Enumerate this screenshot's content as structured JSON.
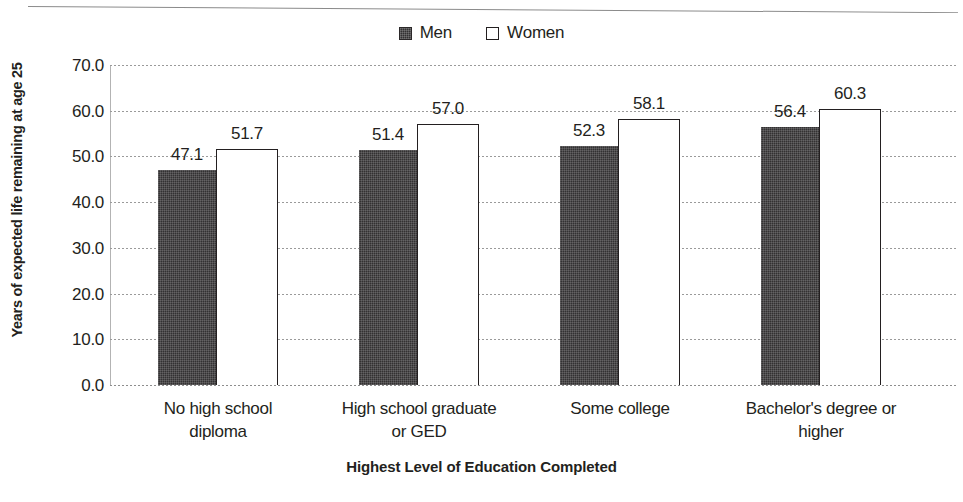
{
  "chart_data": {
    "type": "bar",
    "title": "",
    "subtitle": "",
    "xlabel": "Highest Level of Education Completed",
    "ylabel": "Years of expected life remaining at age 25",
    "categories": [
      "No high school diploma",
      "High school graduate or GED",
      "Some college",
      "Bachelor's degree or higher"
    ],
    "category_lines": [
      [
        "No high school",
        "diploma"
      ],
      [
        "High school graduate",
        "or GED"
      ],
      [
        "Some college",
        ""
      ],
      [
        "Bachelor's degree or",
        "higher"
      ]
    ],
    "series": [
      {
        "name": "Men",
        "color": "#333132",
        "style": "solid-dark-hatched",
        "values": [
          47.1,
          51.4,
          52.3,
          56.4
        ],
        "labels": [
          "47.1",
          "51.4",
          "52.3",
          "56.4"
        ]
      },
      {
        "name": "Women",
        "color": "#ffffff",
        "style": "white-outlined",
        "values": [
          51.7,
          57.0,
          58.1,
          60.3
        ],
        "labels": [
          "51.7",
          "57.0",
          "58.1",
          "60.3"
        ]
      }
    ],
    "ylim": [
      0.0,
      70.0
    ],
    "ytick_step": 10.0,
    "ytick_labels": [
      "70.0",
      "60.0",
      "50.0",
      "40.0",
      "30.0",
      "20.0",
      "10.0",
      "0.0"
    ],
    "ytick_values": [
      70.0,
      60.0,
      50.0,
      40.0,
      30.0,
      20.0,
      10.0,
      0.0
    ],
    "grid": true,
    "grid_style": "dotted",
    "legend_position": "top-center",
    "legend": [
      "Men",
      "Women"
    ],
    "bar_mode": "grouped-adjacent"
  },
  "legend": {
    "men": "Men",
    "women": "Women"
  },
  "axes": {
    "y_title": "Years of expected life remaining at age 25",
    "x_title": "Highest Level of Education Completed"
  },
  "colors": {
    "men_bar": "#333132",
    "women_bar": "#ffffff",
    "women_bar_outline": "#231f20",
    "gridline": "#9a9a9a",
    "text": "#231f20",
    "background": "#ffffff"
  }
}
